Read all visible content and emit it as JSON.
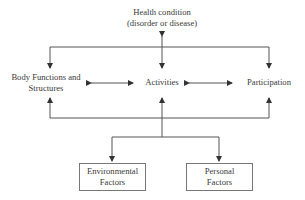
{
  "diagram": {
    "nodes": {
      "health_condition": {
        "line1": "Health condition",
        "line2": "(disorder or disease)"
      },
      "body_functions": {
        "line1": "Body Functions and",
        "line2": "Structures"
      },
      "activities": {
        "label": "Activities"
      },
      "participation": {
        "label": "Participation"
      },
      "environmental": {
        "line1": "Environmental",
        "line2": "Factors"
      },
      "personal": {
        "line1": "Personal",
        "line2": "Factors"
      }
    },
    "edges": [
      {
        "from": "health_condition",
        "to": "activities",
        "type": "bidirectional"
      },
      {
        "from": "health_condition",
        "to": "body_functions",
        "type": "directed"
      },
      {
        "from": "health_condition",
        "to": "participation",
        "type": "directed"
      },
      {
        "from": "body_functions",
        "to": "activities",
        "type": "bidirectional"
      },
      {
        "from": "activities",
        "to": "participation",
        "type": "bidirectional"
      },
      {
        "from": "environmental",
        "to": "body_functions",
        "type": "directed"
      },
      {
        "from": "environmental",
        "to": "activities",
        "type": "directed"
      },
      {
        "from": "environmental",
        "to": "participation",
        "type": "directed"
      },
      {
        "from": "activities",
        "to": "environmental",
        "type": "directed"
      },
      {
        "from": "activities",
        "to": "personal",
        "type": "directed"
      }
    ],
    "colors": {
      "line": "#4a4a4a",
      "text": "#3a3a3a",
      "box_border": "#777777"
    }
  }
}
